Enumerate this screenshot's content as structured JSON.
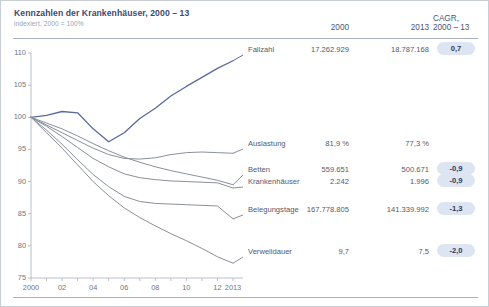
{
  "header": {
    "title": "Kennzahlen der Krankenhäuser, 2000 – 13",
    "subtitle": "indexiert, 2000 = 100%",
    "col_2000": "2000",
    "col_2013": "2013",
    "col_cagr_line1": "CAGR,",
    "col_cagr_line2": "2000 – 13"
  },
  "colors": {
    "accent": "#3d4a72",
    "highlight_line": "#5a6a9e",
    "gray_line": "#8a8f99",
    "badge_bg": "#dde4f2",
    "badge_text": "#2f3a5e",
    "axis": "#b9bec7",
    "frame": "#c9cdd6"
  },
  "chart_data": {
    "type": "line",
    "title": "Kennzahlen der Krankenhäuser, 2000 – 13",
    "subtitle": "indexiert, 2000 = 100%",
    "xlabel": "",
    "ylabel": "",
    "ylim": [
      75,
      110
    ],
    "yticks": [
      75,
      80,
      85,
      90,
      95,
      100,
      105,
      110
    ],
    "xlim": [
      2000,
      2013
    ],
    "xticks": [
      2000,
      2001,
      2002,
      2003,
      2004,
      2005,
      2006,
      2007,
      2008,
      2009,
      2010,
      2011,
      2012,
      2013
    ],
    "xticklabels": [
      "2000",
      "",
      "02",
      "",
      "04",
      "",
      "06",
      "",
      "08",
      "",
      "10",
      "",
      "12",
      "2013"
    ],
    "grid": false,
    "legend": "right-inline-labels",
    "x": [
      2000,
      2001,
      2002,
      2003,
      2004,
      2005,
      2006,
      2007,
      2008,
      2009,
      2010,
      2011,
      2012,
      2013
    ],
    "series": [
      {
        "name": "Fallzahl",
        "color": "#5a6a9e",
        "values": [
          100.0,
          100.3,
          100.9,
          100.7,
          98.2,
          96.2,
          97.6,
          99.8,
          101.4,
          103.3,
          104.8,
          106.2,
          107.6,
          108.8
        ]
      },
      {
        "name": "Auslastung",
        "color": "#8a8f99",
        "values": [
          100.0,
          98.8,
          97.6,
          96.4,
          95.2,
          94.2,
          93.6,
          93.5,
          93.7,
          94.2,
          94.5,
          94.6,
          94.5,
          94.4
        ]
      },
      {
        "name": "Betten",
        "color": "#8a8f99",
        "values": [
          100.0,
          99.1,
          98.2,
          97.1,
          95.9,
          94.8,
          93.8,
          93.0,
          92.3,
          91.7,
          91.2,
          90.7,
          90.2,
          89.5
        ]
      },
      {
        "name": "Krankenhäuser",
        "color": "#8a8f99",
        "values": [
          100.0,
          98.6,
          97.0,
          95.3,
          93.6,
          92.3,
          91.2,
          90.6,
          90.3,
          90.1,
          90.0,
          89.9,
          89.8,
          89.0
        ]
      },
      {
        "name": "Belegungstage",
        "color": "#8a8f99",
        "values": [
          100.0,
          98.0,
          95.8,
          93.4,
          91.1,
          89.2,
          87.7,
          86.9,
          86.6,
          86.5,
          86.4,
          86.3,
          86.2,
          84.2
        ]
      },
      {
        "name": "Verweildauer",
        "color": "#8a8f99",
        "values": [
          100.0,
          97.6,
          95.2,
          92.6,
          90.0,
          87.8,
          85.9,
          84.4,
          83.1,
          81.9,
          80.8,
          79.6,
          78.3,
          77.3
        ]
      }
    ]
  },
  "table": {
    "rows": [
      {
        "label": "Fallzahl",
        "v2000": "17.262.929",
        "v2013": "18.787.168",
        "cagr": "0,7",
        "has_badge": true
      },
      {
        "label": "Auslastung",
        "v2000": "81,9 %",
        "v2013": "77,3 %",
        "cagr": "",
        "has_badge": false
      },
      {
        "label": "Betten",
        "v2000": "559.651",
        "v2013": "500.671",
        "cagr": "-0,9",
        "has_badge": true
      },
      {
        "label": "Krankenhäuser",
        "v2000": "2.242",
        "v2013": "1.996",
        "cagr": "-0,9",
        "has_badge": true
      },
      {
        "label": "Belegungstage",
        "v2000": "167.778.805",
        "v2013": "141.339.992",
        "cagr": "-1,3",
        "has_badge": true
      },
      {
        "label": "Verweildauer",
        "v2000": "9,7",
        "v2013": "7,5",
        "cagr": "-2,0",
        "has_badge": true
      }
    ]
  },
  "axis": {
    "ylabels": [
      "110",
      "105",
      "100",
      "95",
      "90",
      "85",
      "80",
      "75"
    ],
    "xlabels": [
      "2000",
      "02",
      "04",
      "06",
      "08",
      "10",
      "12",
      "2013"
    ]
  }
}
